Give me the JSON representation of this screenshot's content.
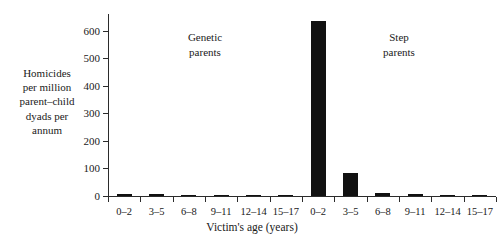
{
  "chart_data": {
    "type": "bar",
    "title": "",
    "xlabel": "Victim's age (years)",
    "ylabel_lines": [
      "Homicides",
      "per million",
      "parent–child",
      "dyads per",
      "annum"
    ],
    "ylim": [
      0,
      660
    ],
    "yticks": [
      0,
      100,
      200,
      300,
      400,
      500,
      600
    ],
    "ytick_labels": [
      "0",
      "100",
      "200",
      "300",
      "400",
      "500",
      "600"
    ],
    "grid": false,
    "legend": "none",
    "categories": [
      "0–2",
      "3–5",
      "6–8",
      "9–11",
      "12–14",
      "15–17",
      "0–2",
      "3–5",
      "6–8",
      "9–11",
      "12–14",
      "15–17"
    ],
    "values": [
      9,
      6,
      3,
      3,
      1,
      1,
      635,
      83,
      10,
      8,
      4,
      5
    ],
    "bar_color": "#111111",
    "groups": [
      {
        "label_lines": [
          "Genetic",
          "parents"
        ],
        "category_indices": [
          0,
          1,
          2,
          3,
          4,
          5
        ]
      },
      {
        "label_lines": [
          "Step",
          "parents"
        ],
        "category_indices": [
          6,
          7,
          8,
          9,
          10,
          11
        ]
      }
    ],
    "annotations": [
      {
        "text": "Genetic parents",
        "x_center_category_index": 2.5
      },
      {
        "text": "Step parents",
        "x_center_category_index": 9.5
      }
    ]
  }
}
